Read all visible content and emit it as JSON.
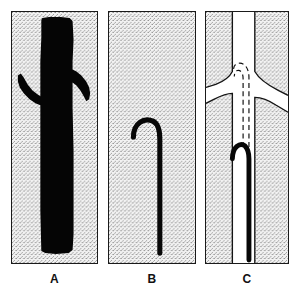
{
  "figure": {
    "width": 301,
    "height": 307,
    "background_color": "#ffffff"
  },
  "colors": {
    "ink": "#000000",
    "outline": "#1a1a1a",
    "stipple_background": "#f0f0f0",
    "stipple_dot": "#7a7a7a",
    "lumen_white": "#ffffff",
    "caption_text": "#111111"
  },
  "panels": [
    {
      "id": "a",
      "caption": "A",
      "kind": "angiogram-silhouette",
      "description": "Solid black vascular silhouette: vertical trunk with two lateral branches flaring left and right",
      "background": "stipple",
      "contents": [
        "vessel-trunk",
        "left-branch",
        "right-branch"
      ]
    },
    {
      "id": "b",
      "caption": "B",
      "kind": "catheter-radiograph",
      "description": "Thin black catheter shaft running vertically with a hooked J-shaped tip curving to the left at the top",
      "background": "stipple",
      "contents": [
        "catheter-shaft",
        "catheter-hook-tip"
      ]
    },
    {
      "id": "c",
      "caption": "C",
      "kind": "schematic-diagram",
      "description": "Line diagram of the vessel lumen in white with outlined walls, the black catheter inside, and a dashed line showing the catheter path advancing up into the branch",
      "background": "stipple",
      "contents": [
        "vessel-wall-outline",
        "vessel-lumen",
        "side-branch-left",
        "side-branch-right",
        "catheter-shaft",
        "catheter-hook-tip",
        "dashed-catheter-path"
      ]
    }
  ],
  "captions": {
    "a": "A",
    "b": "B",
    "c": "C"
  }
}
